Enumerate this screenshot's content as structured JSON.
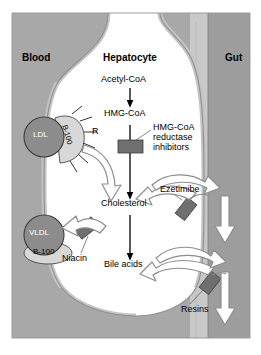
{
  "figure": {
    "regions": {
      "blood": "Blood",
      "hepatocyte": "Hepatocyte",
      "gut": "Gut"
    },
    "pathway": {
      "acetyl_coa": "Acetyl-CoA",
      "hmg_coa": "HMG-CoA",
      "cholesterol": "Cholesterol",
      "bile_acids": "Bile acids"
    },
    "particles": {
      "ldl": "LDL",
      "ldl_apo": "B-100",
      "vldl": "VLDL",
      "vldl_apo": "B-100",
      "receptor": "R"
    },
    "drugs": {
      "statins": "HMG-CoA\nreductase\ninhibitors",
      "statins_line1": "HMG-CoA",
      "statins_line2": "reductase",
      "statins_line3": "inhibitors",
      "ezetimibe": "Ezetimibe",
      "niacin": "Niacin",
      "resins": "Resins"
    },
    "colors": {
      "blood_fill": "#a8a8a8",
      "sinusoid": "#9a9a9a",
      "hepatocyte_fill": "#ffffff",
      "gut_lumen": "#c9c9c9",
      "gut_wall": "#a0a0a0",
      "drug_bar": "#6f6f6f",
      "arrow_solid": "#000000",
      "arrow_hollow_fill": "#ffffff",
      "arrow_hollow_stroke": "#8d8d8d",
      "particle_fill": "#8c8c8c",
      "apo_fill": "#d8d8d8",
      "text": "#000000"
    }
  }
}
